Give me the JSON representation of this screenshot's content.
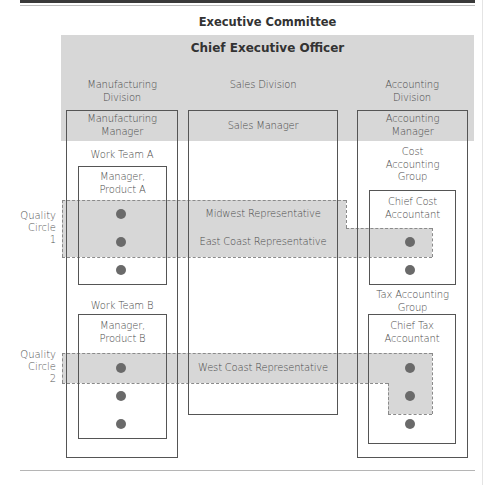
{
  "diagram": {
    "header": {
      "executive_committee": "Executive Committee",
      "ceo": "Chief Executive Officer"
    },
    "divisions": [
      {
        "name": "Manufacturing Division",
        "name_lines": [
          "Manufacturing",
          "Division"
        ],
        "manager": [
          "Manufacturing",
          "Manager"
        ],
        "teams": [
          {
            "name": "Work Team A",
            "manager": [
              "Manager,",
              "Product A"
            ],
            "members": 3
          },
          {
            "name": "Work Team B",
            "manager": [
              "Manager,",
              "Product B"
            ],
            "members": 3
          }
        ]
      },
      {
        "name": "Sales Division",
        "name_lines": [
          "Sales Division"
        ],
        "manager": [
          "Sales Manager"
        ],
        "representatives": [
          "Midwest Representative",
          "East Coast Representative",
          "West Coast Representative"
        ]
      },
      {
        "name": "Accounting Division",
        "name_lines": [
          "Accounting",
          "Division"
        ],
        "manager": [
          "Accounting",
          "Manager"
        ],
        "groups": [
          {
            "name": [
              "Cost",
              "Accounting",
              "Group"
            ],
            "head": [
              "Chief Cost",
              "Accountant"
            ],
            "members": 2
          },
          {
            "name": [
              "Tax Accounting",
              "Group"
            ],
            "head": [
              "Chief Tax",
              "Accountant"
            ],
            "members": 3
          }
        ]
      }
    ],
    "quality_circles": [
      {
        "label": [
          "Quality",
          "Circle",
          "1"
        ],
        "members": [
          "Work Team A member",
          "Work Team A member",
          "Midwest Representative",
          "East Coast Representative",
          "Cost Accounting member"
        ]
      },
      {
        "label": [
          "Quality",
          "Circle",
          "2"
        ],
        "members": [
          "Work Team B member",
          "West Coast Representative",
          "Tax Accounting member",
          "Tax Accounting member"
        ]
      }
    ],
    "colors": {
      "band_gray": "#d7d7d7",
      "circle_gray": "#c8c8c8",
      "line": "#555555",
      "dot": "#6a6a6a",
      "top_bar": "#3a3a3a"
    }
  }
}
